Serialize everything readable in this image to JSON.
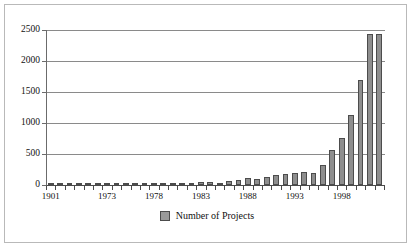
{
  "chart_data": {
    "type": "bar",
    "title": "",
    "xlabel": "",
    "ylabel": "",
    "ylim": [
      0,
      2500
    ],
    "ytick_values": [
      0,
      500,
      1000,
      1500,
      2000,
      2500
    ],
    "ytick_labels": [
      "0",
      "500",
      "1000",
      "1500",
      "2000",
      "2500"
    ],
    "grid": true,
    "legend_position": "bottom-center",
    "legend": [
      "Number of Projects"
    ],
    "series_name": "Number of Projects",
    "bar_color": "#8e8e8e",
    "bar_border_color": "#4c4c4c",
    "categories": [
      "1901",
      "1968",
      "1969",
      "1970",
      "1971",
      "1972",
      "1973",
      "1974",
      "1975",
      "1976",
      "1977",
      "1978",
      "1979",
      "1980",
      "1981",
      "1982",
      "1983",
      "1984",
      "1985",
      "1986",
      "1987",
      "1988",
      "1989",
      "1990",
      "1991",
      "1992",
      "1993",
      "1994",
      "1995",
      "1996",
      "1997",
      "1998",
      "1999",
      "2000",
      "2001",
      "2002"
    ],
    "labeled_ticks": [
      "1901",
      "1973",
      "1978",
      "1983",
      "1988",
      "1993",
      "1998"
    ],
    "values": [
      10,
      12,
      10,
      14,
      12,
      16,
      14,
      18,
      16,
      20,
      18,
      22,
      20,
      26,
      24,
      30,
      55,
      45,
      30,
      60,
      80,
      120,
      90,
      130,
      160,
      175,
      200,
      215,
      200,
      330,
      560,
      760,
      1130,
      1700,
      2440,
      2440
    ],
    "max_value": 2440
  },
  "legend": {
    "swatch_name": "legend-swatch",
    "label": "Number of Projects"
  }
}
